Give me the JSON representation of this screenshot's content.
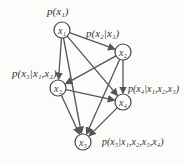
{
  "nodes": [
    {
      "id": "x1",
      "label": "x₁",
      "cx": 62,
      "cy": 30
    },
    {
      "id": "x2",
      "label": "x₂",
      "cx": 123,
      "cy": 52
    },
    {
      "id": "x3",
      "label": "x₃",
      "cx": 58,
      "cy": 88
    },
    {
      "id": "x4",
      "label": "x₄",
      "cx": 123,
      "cy": 102
    },
    {
      "id": "x5",
      "label": "x₅",
      "cx": 83,
      "cy": 142
    }
  ],
  "edges": [
    [
      "x1",
      "x2"
    ],
    [
      "x1",
      "x3"
    ],
    [
      "x1",
      "x4"
    ],
    [
      "x1",
      "x5"
    ],
    [
      "x2",
      "x3"
    ],
    [
      "x2",
      "x4"
    ],
    [
      "x2",
      "x5"
    ],
    [
      "x3",
      "x4"
    ],
    [
      "x3",
      "x5"
    ],
    [
      "x4",
      "x5"
    ]
  ],
  "labels": {
    "p1": "p(x₁)",
    "p2": "p(x₂|x₁)",
    "p3": "p(x₃|x₁,x₂)",
    "p4": "p(x₄|x₁,x₂,x₃)",
    "p5": "p(x₅|x₁,x₂,x₃,x₄)"
  },
  "colors": {
    "edge": "#555555",
    "node": "#444444"
  }
}
